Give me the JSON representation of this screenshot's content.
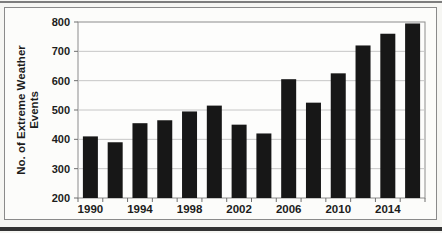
{
  "page": {
    "background": "#f6f6f3",
    "top_rule_color": "#7d7d7d",
    "bottom_rule_color": "#333333",
    "figure_border_color": "#8a8a8a",
    "figure_background": "#fcfcfa"
  },
  "chart_data": {
    "type": "bar",
    "title": "",
    "xlabel": "",
    "ylabel": "No. of Extreme Weather Events",
    "ylabel_lines": [
      "No. of Extreme Weather",
      "Events"
    ],
    "categories": [
      "1990",
      "1992",
      "1994",
      "1996",
      "1998",
      "2000",
      "2002",
      "2004",
      "2006",
      "2008",
      "2010",
      "2012",
      "2014",
      "2016"
    ],
    "values": [
      410,
      390,
      455,
      465,
      495,
      515,
      450,
      420,
      605,
      525,
      625,
      720,
      760,
      795
    ],
    "x_tick_labels_shown": [
      "1990",
      "1994",
      "1998",
      "2002",
      "2006",
      "2010",
      "2014"
    ],
    "ylim": [
      200,
      800
    ],
    "yticks": [
      200,
      300,
      400,
      500,
      600,
      700,
      800
    ],
    "grid": true,
    "legend": "none",
    "bar_color": "#171717",
    "grid_color": "#c6c6c6",
    "axis_color": "#8c8c8c",
    "tick_color": "#6f6f6f",
    "label_color": "#1c1c1c",
    "plot_background": "#fdfdfc"
  }
}
